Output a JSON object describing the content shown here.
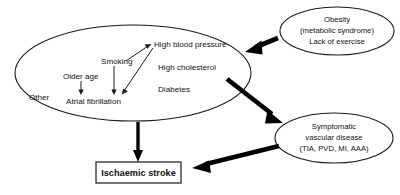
{
  "figure": {
    "name": "ischaemic-stroke-risk-factor-diagram",
    "background_color": "#ffffff",
    "line_color": "#1a1a1a"
  },
  "main_group": {
    "name": "modifiable-and-non-modifiable-risk-factors",
    "risk_factors": [
      {
        "id": "other",
        "label": "Other"
      },
      {
        "id": "older_age",
        "label": "Older age"
      },
      {
        "id": "smoking",
        "label": "Smoking"
      },
      {
        "id": "atrial_fibrillation",
        "label": "Atrial fibrillation"
      },
      {
        "id": "high_blood_pressure",
        "label": "High blood pressure"
      },
      {
        "id": "high_cholesterol",
        "label": "High cholesterol"
      },
      {
        "id": "diabetes",
        "label": "Diabetes"
      }
    ]
  },
  "obesity_group": {
    "name": "obesity-cluster",
    "line1": "Obesity",
    "line2": "(metabolic syndrome)",
    "line3": "Lack of exercise"
  },
  "vascular_group": {
    "name": "symptomatic-vascular-disease-cluster",
    "line1": "Symptomatic",
    "line2": "vascular disease",
    "line3": "(TIA, PVD, MI, AAA)"
  },
  "outcome": {
    "name": "ischaemic-stroke-outcome",
    "label": "Ischaemic stroke"
  },
  "connections": [
    {
      "id": "smoking-to-hbp",
      "from": "Smoking",
      "to": "High blood pressure",
      "weight": "thin"
    },
    {
      "id": "hbp-to-af",
      "from": "High blood pressure",
      "to": "Atrial fibrillation",
      "weight": "thin"
    },
    {
      "id": "older-age-down",
      "from": "Older age",
      "to": "Atrial fibrillation",
      "weight": "thin"
    },
    {
      "id": "smoking-down",
      "from": "Smoking",
      "to": "Atrial fibrillation",
      "weight": "thin"
    },
    {
      "id": "obesity-to-risk-factors",
      "from": "Obesity",
      "to": "Risk factor group",
      "weight": "thick"
    },
    {
      "id": "risk-factors-to-vascular",
      "from": "Risk factor group",
      "to": "Symptomatic vascular disease",
      "weight": "thick"
    },
    {
      "id": "vascular-to-stroke",
      "from": "Symptomatic vascular disease",
      "to": "Ischaemic stroke",
      "weight": "thick"
    },
    {
      "id": "risk-factors-to-stroke",
      "from": "Risk factor group",
      "to": "Ischaemic stroke",
      "weight": "medium"
    }
  ]
}
